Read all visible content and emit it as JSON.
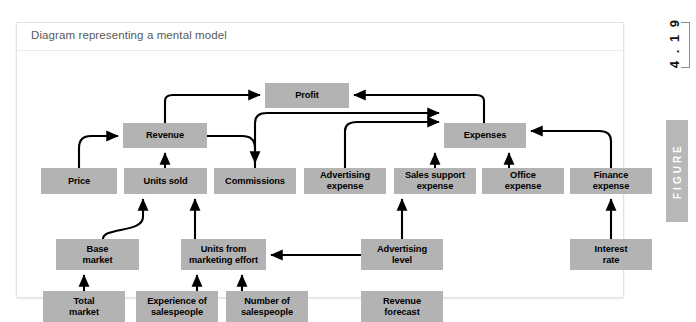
{
  "figure": {
    "caption": "Diagram representing a mental model",
    "number": "4 . 1 9",
    "rail_label": "FIGURE",
    "box_color": "#b3b3b3",
    "arrow_color": "#000000",
    "card_background": "#ffffff"
  },
  "diagram": {
    "type": "influence-diagram",
    "nodes": [
      {
        "id": "profit",
        "label": "Profit",
        "x": 248,
        "y": 32,
        "w": 84,
        "h": 25
      },
      {
        "id": "revenue",
        "label": "Revenue",
        "x": 106,
        "y": 72,
        "w": 84,
        "h": 25
      },
      {
        "id": "expenses",
        "label": "Expenses",
        "x": 427,
        "y": 72,
        "w": 82,
        "h": 25
      },
      {
        "id": "price",
        "label": "Price",
        "x": 24,
        "y": 117,
        "w": 76,
        "h": 26
      },
      {
        "id": "units-sold",
        "label": "Units sold",
        "x": 107,
        "y": 117,
        "w": 83,
        "h": 26
      },
      {
        "id": "commissions",
        "label": "Commissions",
        "x": 197,
        "y": 117,
        "w": 82,
        "h": 26
      },
      {
        "id": "advertising-expense",
        "label": "Advertising\nexpense",
        "x": 287,
        "y": 117,
        "w": 82,
        "h": 26
      },
      {
        "id": "sales-support-expense",
        "label": "Sales support\nexpense",
        "x": 377,
        "y": 117,
        "w": 82,
        "h": 26
      },
      {
        "id": "office-expense",
        "label": "Office\nexpense",
        "x": 465,
        "y": 117,
        "w": 82,
        "h": 26
      },
      {
        "id": "finance-expense",
        "label": "Finance\nexpense",
        "x": 553,
        "y": 117,
        "w": 82,
        "h": 26
      },
      {
        "id": "base-market",
        "label": "Base\nmarket",
        "x": 39,
        "y": 188,
        "w": 83,
        "h": 31
      },
      {
        "id": "units-from-marketing",
        "label": "Units from\nmarketing effort",
        "x": 164,
        "y": 188,
        "w": 85,
        "h": 31
      },
      {
        "id": "advertising-level",
        "label": "Advertising\nlevel",
        "x": 344,
        "y": 188,
        "w": 82,
        "h": 31
      },
      {
        "id": "interest-rate",
        "label": "Interest\nrate",
        "x": 553,
        "y": 188,
        "w": 82,
        "h": 31
      },
      {
        "id": "total-market",
        "label": "Total\nmarket",
        "x": 26,
        "y": 240,
        "w": 82,
        "h": 31
      },
      {
        "id": "experience-salespeople",
        "label": "Experience of\nsalespeople",
        "x": 119,
        "y": 240,
        "w": 82,
        "h": 31
      },
      {
        "id": "number-salespeople",
        "label": "Number of\nsalespeople",
        "x": 209,
        "y": 240,
        "w": 82,
        "h": 31
      },
      {
        "id": "revenue-forecast",
        "label": "Revenue\nforecast",
        "x": 344,
        "y": 240,
        "w": 82,
        "h": 31
      }
    ],
    "edges": [
      {
        "from": "revenue",
        "to": "profit"
      },
      {
        "from": "expenses",
        "to": "profit"
      },
      {
        "from": "price",
        "to": "revenue"
      },
      {
        "from": "units-sold",
        "to": "revenue"
      },
      {
        "from": "revenue",
        "to": "commissions"
      },
      {
        "from": "commissions",
        "to": "expenses"
      },
      {
        "from": "advertising-expense",
        "to": "expenses"
      },
      {
        "from": "sales-support-expense",
        "to": "expenses"
      },
      {
        "from": "office-expense",
        "to": "expenses"
      },
      {
        "from": "finance-expense",
        "to": "expenses"
      },
      {
        "from": "base-market",
        "to": "units-sold"
      },
      {
        "from": "units-from-marketing",
        "to": "units-sold"
      },
      {
        "from": "total-market",
        "to": "base-market"
      },
      {
        "from": "experience-salespeople",
        "to": "units-from-marketing"
      },
      {
        "from": "number-salespeople",
        "to": "units-from-marketing"
      },
      {
        "from": "advertising-level",
        "to": "units-from-marketing"
      },
      {
        "from": "advertising-level",
        "to": "advertising-expense"
      },
      {
        "from": "revenue-forecast",
        "to": "number-salespeople"
      },
      {
        "from": "interest-rate",
        "to": "finance-expense"
      }
    ]
  }
}
